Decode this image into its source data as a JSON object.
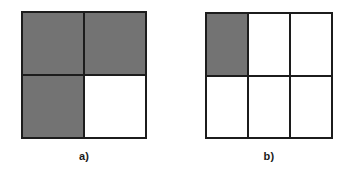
{
  "page": {
    "background_color": "#ffffff",
    "width": 355,
    "height": 174
  },
  "style": {
    "shaded_color": "#737373",
    "empty_color": "#ffffff",
    "line_color": "#1c1c1c",
    "label_color": "#1a1a1a"
  },
  "figures": [
    {
      "id": "a",
      "label": "a)",
      "columns": 2,
      "rows": 2,
      "shaded_count": 3,
      "total_cells": 4,
      "cells": [
        {
          "row": 0,
          "col": 0,
          "shaded": true
        },
        {
          "row": 0,
          "col": 1,
          "shaded": true
        },
        {
          "row": 1,
          "col": 0,
          "shaded": true
        },
        {
          "row": 1,
          "col": 1,
          "shaded": false
        }
      ]
    },
    {
      "id": "b",
      "label": "b)",
      "columns": 3,
      "rows": 2,
      "shaded_count": 1,
      "total_cells": 6,
      "cells": [
        {
          "row": 0,
          "col": 0,
          "shaded": true
        },
        {
          "row": 0,
          "col": 1,
          "shaded": false
        },
        {
          "row": 0,
          "col": 2,
          "shaded": false
        },
        {
          "row": 1,
          "col": 0,
          "shaded": false
        },
        {
          "row": 1,
          "col": 1,
          "shaded": false
        },
        {
          "row": 1,
          "col": 2,
          "shaded": false
        }
      ]
    }
  ]
}
